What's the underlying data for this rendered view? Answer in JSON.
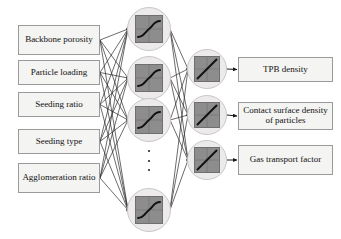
{
  "diagram": {
    "type": "neural-network",
    "colors": {
      "box_fill": "#f4f4f2",
      "box_border": "#9a9a9a",
      "node_circle_fill": "#eceaea",
      "node_circle_border": "#c9c7c7",
      "node_square_fill": "#8d8d8d",
      "node_square_border": "#6f6f6f",
      "edge": "#2b2b2b",
      "text": "#111111",
      "background": "#ffffff"
    },
    "layers": {
      "input": {
        "name": "Input layer",
        "count": 5,
        "nodes": [
          {
            "id": "in-1",
            "label": "Backbone porosity",
            "x": 18,
            "y": 25,
            "w": 82,
            "h": 30
          },
          {
            "id": "in-2",
            "label": "Particle loading",
            "x": 18,
            "y": 60,
            "w": 82,
            "h": 25
          },
          {
            "id": "in-3",
            "label": "Seeding ratio",
            "x": 18,
            "y": 92,
            "w": 82,
            "h": 25
          },
          {
            "id": "in-4",
            "label": "Seeding type",
            "x": 18,
            "y": 129,
            "w": 82,
            "h": 25
          },
          {
            "id": "in-5",
            "label": "Agglomeration ratio",
            "x": 18,
            "y": 163,
            "w": 82,
            "h": 30
          }
        ]
      },
      "hidden": {
        "name": "Hidden layer",
        "activation": "sigmoid",
        "activation_icon": "sigmoid-curve-icon",
        "visible_count": 4,
        "ellipsis": true,
        "nodes": [
          {
            "id": "h-1",
            "cx": 149,
            "cy": 29,
            "r": 22
          },
          {
            "id": "h-2",
            "cx": 149,
            "cy": 78,
            "r": 22
          },
          {
            "id": "h-3",
            "cx": 149,
            "cy": 120,
            "r": 22
          },
          {
            "id": "h-4",
            "cx": 149,
            "cy": 210,
            "r": 22
          }
        ],
        "ellipsis_pos": {
          "cx": 149,
          "cy": 160
        }
      },
      "output": {
        "name": "Output layer",
        "activation": "linear",
        "activation_icon": "linear-line-icon",
        "count": 3,
        "nodes": [
          {
            "id": "o-1",
            "cx": 207,
            "cy": 69,
            "r": 20
          },
          {
            "id": "o-2",
            "cx": 207,
            "cy": 115,
            "r": 20
          },
          {
            "id": "o-3",
            "cx": 207,
            "cy": 160,
            "r": 20
          }
        ]
      },
      "result": {
        "name": "Predicted outputs",
        "count": 3,
        "nodes": [
          {
            "id": "out-1",
            "label": "TPB density",
            "x": 238,
            "y": 57,
            "w": 95,
            "h": 25
          },
          {
            "id": "out-2",
            "label": "Contact surface density of particles",
            "x": 238,
            "y": 102,
            "w": 95,
            "h": 28
          },
          {
            "id": "out-3",
            "label": "Gas transport factor",
            "x": 238,
            "y": 145,
            "w": 95,
            "h": 30
          }
        ]
      }
    },
    "connections": {
      "input_to_hidden": "fully-connected",
      "hidden_to_output": "fully-connected",
      "output_to_result": "one-to-one-arrow"
    }
  }
}
